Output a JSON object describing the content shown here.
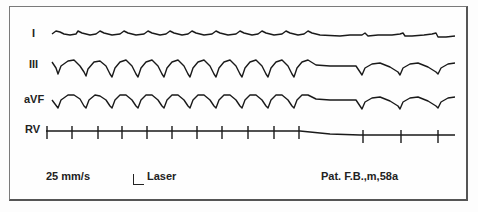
{
  "figure": {
    "leads": [
      {
        "id": "I",
        "label": "I"
      },
      {
        "id": "III",
        "label": "III"
      },
      {
        "id": "aVF",
        "label": "aVF"
      },
      {
        "id": "RV",
        "label": "RV"
      }
    ],
    "footer": {
      "speed": "25 mm/s",
      "marker_label": "Laser",
      "patient": "Pat. F.B.,m,58a"
    },
    "rv_ticks_x": [
      47,
      72,
      98,
      122,
      147,
      172,
      197,
      222,
      248,
      274,
      299,
      363,
      401,
      438
    ],
    "colors": {
      "trace": "#1a1a1a",
      "border": "#6e6e6e",
      "background": "#fdfdfd"
    }
  }
}
